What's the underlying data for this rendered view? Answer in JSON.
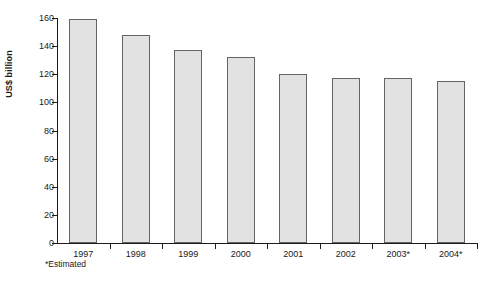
{
  "chart_data": {
    "type": "bar",
    "title": "",
    "subtitle": "",
    "xlabel": "",
    "ylabel": "US$ billion",
    "categories": [
      "1997",
      "1998",
      "1999",
      "2000",
      "2001",
      "2002",
      "2003*",
      "2004*"
    ],
    "values": [
      159,
      148,
      137,
      132,
      120,
      117.5,
      117,
      115.5
    ],
    "ylim": [
      0,
      160
    ],
    "yticks": [
      0,
      20,
      40,
      60,
      80,
      100,
      120,
      140,
      160
    ],
    "ytick_labels": [
      "0",
      "20",
      "40",
      "60",
      "80",
      "100",
      "120",
      "140",
      "160"
    ],
    "grid": false,
    "legend": "none",
    "annotations": [
      "*Estimated"
    ],
    "bar_fill_color": "#e2e2e2",
    "bar_border_color": "#646464",
    "axis_color": "#1a1a1a",
    "background_color": "#ffffff"
  },
  "footnote": {
    "text": "*Estimated"
  }
}
